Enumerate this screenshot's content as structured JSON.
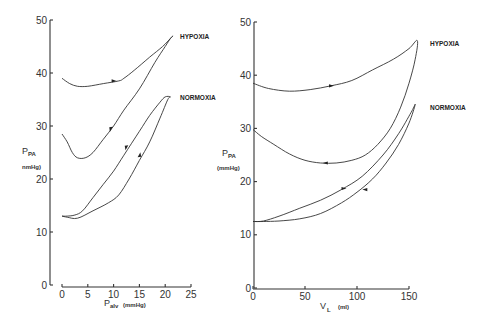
{
  "chart_data": [
    {
      "type": "line",
      "title": "",
      "xlabel": "P_alv",
      "xlabel_main": "P",
      "xlabel_sub": "alv",
      "xlabel_unit": "(mmHg)",
      "ylabel_main": "P",
      "ylabel_sub": "PA",
      "ylabel_unit": "nmHg)",
      "xlim": [
        0,
        25
      ],
      "ylim": [
        0,
        50
      ],
      "xticks": [
        0,
        5,
        10,
        15,
        20,
        25
      ],
      "xtick_labels": [
        "0",
        "5",
        "10",
        "15",
        "20",
        "25"
      ],
      "yticks": [
        0,
        10,
        20,
        30,
        40,
        50
      ],
      "ytick_labels": [
        "0",
        "10",
        "20",
        "30",
        "40",
        "50"
      ],
      "grid": false,
      "series": [
        {
          "name": "HYPOXIA",
          "label": "HYPOXIA",
          "x": [
            0,
            1.5,
            3,
            5,
            8,
            11,
            12,
            14,
            17,
            19.5,
            21,
            21.5,
            21,
            20,
            18,
            15,
            12,
            10,
            8,
            6,
            4.5,
            3,
            2,
            1,
            0
          ],
          "y": [
            39,
            38,
            37.5,
            37.5,
            38,
            38.5,
            39,
            40.5,
            43,
            45,
            46.5,
            47,
            46.5,
            45,
            42,
            37,
            33,
            30,
            27.5,
            25,
            24,
            24,
            25,
            27,
            28.5
          ],
          "arrows": [
            {
              "x": 10,
              "y": 38.5,
              "dir": "right"
            },
            {
              "x": 9.5,
              "y": 29.5,
              "dir": "down"
            }
          ]
        },
        {
          "name": "NORMOXIA",
          "label": "NORMOXIA",
          "x": [
            0,
            1,
            3,
            6,
            9,
            11,
            13,
            15,
            17,
            19,
            20.5,
            21,
            20,
            19,
            17,
            15,
            12,
            10,
            8,
            6,
            4,
            2.5,
            1,
            0
          ],
          "y": [
            13,
            12.8,
            12.6,
            14,
            15.5,
            17,
            20,
            23.5,
            27,
            31.5,
            35,
            35.5,
            35.5,
            34.5,
            32,
            29,
            24.5,
            21.5,
            19,
            16.5,
            14,
            13.2,
            13,
            13
          ],
          "arrows": [
            {
              "x": 12.5,
              "y": 26,
              "dir": "down"
            },
            {
              "x": 15,
              "y": 24.5,
              "dir": "up"
            }
          ]
        }
      ],
      "legend": "inline-right"
    },
    {
      "type": "line",
      "title": "",
      "xlabel": "V_L",
      "xlabel_main": "V",
      "xlabel_sub": "L",
      "xlabel_unit": "(ml)",
      "ylabel_main": "P",
      "ylabel_sub": "PA",
      "ylabel_unit": "(mmHg)",
      "xlim": [
        0,
        150
      ],
      "ylim": [
        0,
        50
      ],
      "xticks": [
        0,
        50,
        100,
        150
      ],
      "xtick_labels": [
        "0",
        "50",
        "100",
        "150"
      ],
      "yticks": [
        0,
        10,
        20,
        30,
        40,
        50
      ],
      "ytick_labels": [
        "0",
        "10",
        "20",
        "30",
        "40",
        "50"
      ],
      "grid": false,
      "series": [
        {
          "name": "HYPOXIA",
          "label": "HYPOXIA",
          "x": [
            0,
            15,
            35,
            55,
            75,
            95,
            115,
            135,
            150,
            158,
            156,
            150,
            142,
            132,
            120,
            108,
            95,
            80,
            65,
            50,
            35,
            20,
            8,
            0
          ],
          "y": [
            38.5,
            37.5,
            37,
            37.3,
            38,
            39,
            41,
            43,
            45,
            46.5,
            43,
            38.5,
            34,
            30,
            27,
            25,
            24,
            23.5,
            23.5,
            24,
            25.2,
            27,
            28.5,
            29.8
          ],
          "arrows": [
            {
              "x": 75,
              "y": 38,
              "dir": "right"
            },
            {
              "x": 70,
              "y": 23.5,
              "dir": "left"
            }
          ]
        },
        {
          "name": "NORMOXIA",
          "label": "NORMOXIA",
          "x": [
            0,
            10,
            25,
            45,
            65,
            85,
            105,
            125,
            140,
            152,
            156,
            150,
            140,
            128,
            115,
            100,
            85,
            65,
            45,
            25,
            10,
            0
          ],
          "y": [
            12.5,
            12.6,
            13.5,
            15,
            16.5,
            18.5,
            21,
            25,
            29,
            33,
            34.5,
            31,
            27,
            23.5,
            20.5,
            18,
            16,
            14,
            13,
            12.6,
            12.5,
            12.5
          ],
          "arrows": [
            {
              "x": 87,
              "y": 18.7,
              "dir": "right"
            },
            {
              "x": 108,
              "y": 18.5,
              "dir": "left"
            }
          ]
        }
      ],
      "legend": "inline-right"
    }
  ]
}
